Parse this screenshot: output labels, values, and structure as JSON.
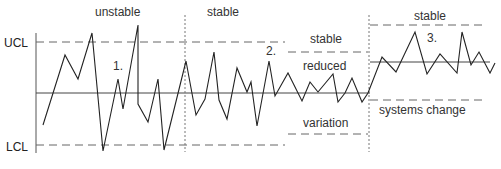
{
  "chart_data": {
    "type": "line",
    "title": "",
    "axis_labels": {
      "ucl": "UCL",
      "lcl": "LCL"
    },
    "phases": [
      {
        "number": "1.",
        "label_top": "unstable",
        "label_number": "1."
      },
      {
        "number": "2.",
        "label_top": "stable",
        "label_side_top": "stable",
        "label_middle": "reduced",
        "label_bottom": "variation",
        "label_number": "2."
      },
      {
        "number": "3.",
        "label_top": "stable",
        "label_bottom": "systems change",
        "label_number": "3."
      }
    ],
    "grid": false,
    "series": [
      {
        "name": "process",
        "points": [
          [
            43,
            125
          ],
          [
            65,
            55
          ],
          [
            78,
            79
          ],
          [
            92,
            33
          ],
          [
            103,
            151
          ],
          [
            118,
            79
          ],
          [
            123,
            109
          ],
          [
            138,
            25
          ],
          [
            138,
            104
          ],
          [
            148,
            122
          ],
          [
            158,
            79
          ],
          [
            164,
            150
          ],
          [
            186,
            61
          ],
          [
            196,
            115
          ],
          [
            205,
            99
          ],
          [
            214,
            52
          ],
          [
            219,
            100
          ],
          [
            227,
            119
          ],
          [
            237,
            68
          ],
          [
            247,
            92
          ],
          [
            251,
            82
          ],
          [
            257,
            126
          ],
          [
            269,
            61
          ],
          [
            275,
            96
          ],
          [
            288,
            73
          ],
          [
            302,
            101
          ],
          [
            310,
            82
          ],
          [
            318,
            92
          ],
          [
            333,
            74
          ],
          [
            338,
            102
          ],
          [
            345,
            93
          ],
          [
            352,
            78
          ],
          [
            362,
            102
          ],
          [
            368,
            93
          ],
          [
            382,
            57
          ],
          [
            396,
            72
          ],
          [
            415,
            32
          ],
          [
            427,
            74
          ],
          [
            440,
            54
          ],
          [
            457,
            73
          ],
          [
            462,
            32
          ],
          [
            471,
            65
          ],
          [
            479,
            52
          ],
          [
            490,
            73
          ],
          [
            495,
            63
          ]
        ]
      }
    ]
  },
  "labels": {
    "ucl": "UCL",
    "lcl": "LCL",
    "unstable": "unstable",
    "stable1": "stable",
    "stable2": "stable",
    "reduced": "reduced",
    "variation": "variation",
    "stable3": "stable",
    "systems_change": "systems change",
    "n1": "1.",
    "n2": "2.",
    "n3": "3."
  }
}
